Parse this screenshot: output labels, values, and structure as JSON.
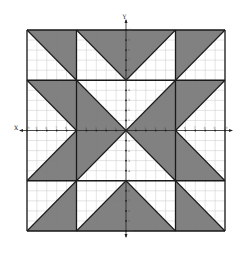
{
  "diagram": {
    "type": "coordinate-grid-quilt-pattern",
    "axes": {
      "x_label": "X",
      "y_label": "Y",
      "x_range": [
        -10,
        10
      ],
      "y_range": [
        -10,
        10
      ],
      "tick_step": 1,
      "x_ticks": [
        -10,
        -9,
        -8,
        -7,
        -6,
        -5,
        -4,
        -3,
        -2,
        -1,
        1,
        2,
        3,
        4,
        5,
        6,
        7,
        8,
        9,
        10
      ],
      "y_ticks": [
        -10,
        -9,
        -8,
        -7,
        -6,
        -5,
        -4,
        -3,
        -2,
        -1,
        1,
        2,
        3,
        4,
        5,
        6,
        7,
        8,
        9,
        10
      ]
    },
    "grid": {
      "minor_step": 1,
      "show": true,
      "color": "#c8c8c8"
    },
    "colors": {
      "shaded": "#7a7a7a",
      "unshaded": "#ffffff",
      "outline": "#1a1a1a",
      "axis": "#222222"
    },
    "block_lines": {
      "vertical": [
        -10,
        -5,
        5,
        10
      ],
      "horizontal": [
        10,
        5,
        -5,
        -10
      ]
    },
    "shaded_regions": [
      {
        "name": "top-left-triangle",
        "points": [
          [
            -10,
            10
          ],
          [
            -5,
            10
          ],
          [
            -5,
            5
          ]
        ]
      },
      {
        "name": "top-middle-triangle",
        "points": [
          [
            -5,
            10
          ],
          [
            5,
            10
          ],
          [
            0,
            5
          ]
        ]
      },
      {
        "name": "top-right-triangle",
        "points": [
          [
            5,
            10
          ],
          [
            10,
            10
          ],
          [
            5,
            5
          ]
        ]
      },
      {
        "name": "middle-left-upper-triangle",
        "points": [
          [
            -10,
            5
          ],
          [
            -5,
            5
          ],
          [
            -5,
            0
          ]
        ]
      },
      {
        "name": "middle-left-lower-triangle",
        "points": [
          [
            -5,
            0
          ],
          [
            -5,
            -5
          ],
          [
            -10,
            -5
          ]
        ]
      },
      {
        "name": "center-left-triangle",
        "points": [
          [
            -5,
            5
          ],
          [
            0,
            0
          ],
          [
            -5,
            -5
          ]
        ]
      },
      {
        "name": "center-right-triangle",
        "points": [
          [
            5,
            5
          ],
          [
            0,
            0
          ],
          [
            5,
            -5
          ]
        ]
      },
      {
        "name": "middle-right-upper-triangle",
        "points": [
          [
            5,
            5
          ],
          [
            10,
            5
          ],
          [
            5,
            0
          ]
        ]
      },
      {
        "name": "middle-right-lower-triangle",
        "points": [
          [
            5,
            0
          ],
          [
            10,
            -5
          ],
          [
            5,
            -5
          ]
        ]
      },
      {
        "name": "bottom-left-triangle",
        "points": [
          [
            -5,
            -5
          ],
          [
            -5,
            -10
          ],
          [
            -10,
            -10
          ]
        ]
      },
      {
        "name": "bottom-middle-triangle",
        "points": [
          [
            0,
            -5
          ],
          [
            -5,
            -10
          ],
          [
            5,
            -10
          ]
        ]
      },
      {
        "name": "bottom-right-triangle",
        "points": [
          [
            5,
            -5
          ],
          [
            10,
            -10
          ],
          [
            5,
            -10
          ]
        ]
      }
    ],
    "diagonal_lines": [
      [
        [
          -10,
          10
        ],
        [
          -5,
          5
        ]
      ],
      [
        [
          -5,
          10
        ],
        [
          0,
          5
        ]
      ],
      [
        [
          5,
          10
        ],
        [
          0,
          5
        ]
      ],
      [
        [
          10,
          10
        ],
        [
          5,
          5
        ]
      ],
      [
        [
          -10,
          5
        ],
        [
          -5,
          0
        ]
      ],
      [
        [
          -10,
          -5
        ],
        [
          -5,
          0
        ]
      ],
      [
        [
          -5,
          5
        ],
        [
          5,
          -5
        ]
      ],
      [
        [
          -5,
          -5
        ],
        [
          5,
          5
        ]
      ],
      [
        [
          10,
          5
        ],
        [
          5,
          0
        ]
      ],
      [
        [
          10,
          -5
        ],
        [
          5,
          0
        ]
      ],
      [
        [
          -10,
          -10
        ],
        [
          -5,
          -5
        ]
      ],
      [
        [
          -5,
          -10
        ],
        [
          0,
          -5
        ]
      ],
      [
        [
          5,
          -10
        ],
        [
          0,
          -5
        ]
      ],
      [
        [
          10,
          -10
        ],
        [
          5,
          -5
        ]
      ]
    ]
  }
}
